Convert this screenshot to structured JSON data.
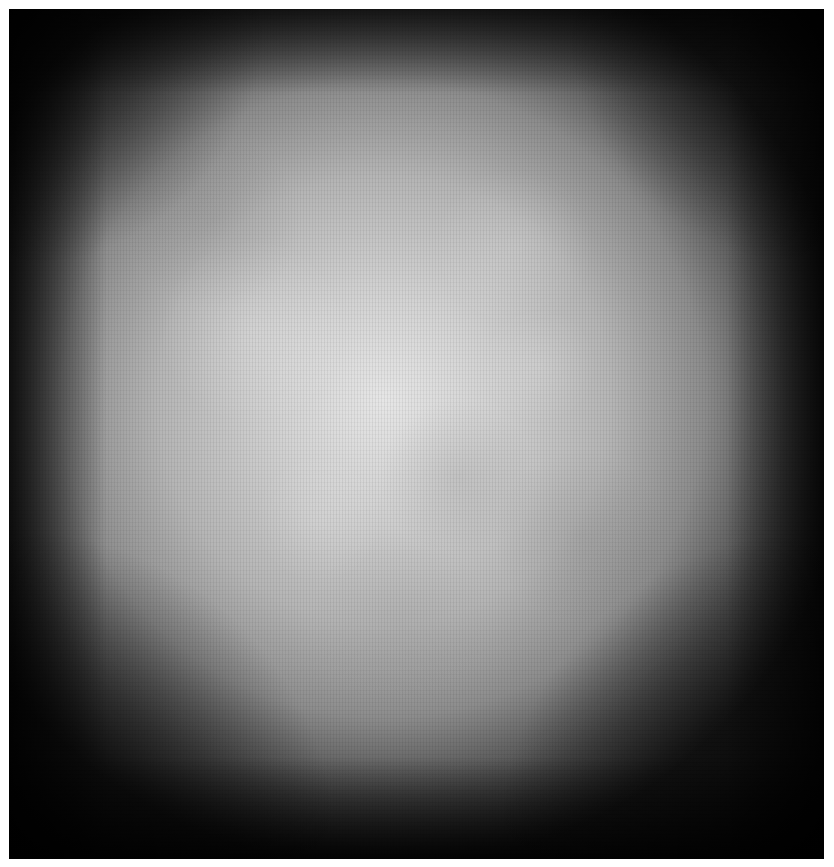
{
  "image": {
    "description": "Square grayscale grunge texture with bright mottled center and dark vignette edges",
    "colors": {
      "page_background": "#ffffff",
      "center_highlight": "#e6e6e6",
      "mid_gray": "#b4b4b4",
      "edge_dark": "#1a1a1a"
    }
  }
}
